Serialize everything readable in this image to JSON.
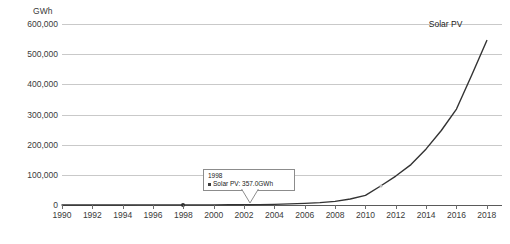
{
  "chart_data": {
    "type": "line",
    "title": "",
    "xlabel": "",
    "ylabel": "GWh",
    "unit_label": "GWh",
    "xlim": [
      1990,
      2019
    ],
    "ylim": [
      0,
      600000
    ],
    "grid": true,
    "legend_position": "inline-end-label",
    "y_ticks": [
      "600,000",
      "500,000",
      "400,000",
      "300,000",
      "200,000",
      "100,000",
      "0"
    ],
    "y_tick_values": [
      600000,
      500000,
      400000,
      300000,
      200000,
      100000,
      0
    ],
    "x_ticks": [
      "1990",
      "1992",
      "1994",
      "1996",
      "1998",
      "2000",
      "2002",
      "2004",
      "2006",
      "2008",
      "2010",
      "2012",
      "2014",
      "2016",
      "2018"
    ],
    "x_tick_values": [
      1990,
      1992,
      1994,
      1996,
      1998,
      2000,
      2002,
      2004,
      2006,
      2008,
      2010,
      2012,
      2014,
      2016,
      2018
    ],
    "series": [
      {
        "name": "Solar PV",
        "color": "#333333",
        "x": [
          1990,
          1991,
          1992,
          1993,
          1994,
          1995,
          1996,
          1997,
          1998,
          1999,
          2000,
          2001,
          2002,
          2003,
          2004,
          2005,
          2006,
          2007,
          2008,
          2009,
          2010,
          2011,
          2012,
          2013,
          2014,
          2015,
          2016,
          2017,
          2018
        ],
        "values": [
          90,
          110,
          135,
          165,
          200,
          250,
          300,
          330,
          357,
          430,
          560,
          720,
          950,
          1400,
          2200,
          3600,
          5500,
          8000,
          12000,
          20000,
          32000,
          63000,
          96000,
          134000,
          186000,
          247000,
          318000,
          430000,
          545000
        ]
      }
    ],
    "annotations": [
      {
        "type": "tooltip",
        "title": "1998",
        "series_name": "Solar PV",
        "value_text": "Solar PV: 357.0GWh",
        "swatch_color": "#3c3c3c",
        "anchor_year": 1998,
        "anchor_value": 357
      },
      {
        "type": "series-end-label",
        "text": "Solar PV"
      }
    ],
    "markers": [
      {
        "year": 1998,
        "value": 357,
        "style": "filled"
      },
      {
        "year": 2011,
        "value": 63000,
        "style": "hollow"
      }
    ]
  },
  "axes": {
    "unit": "GWh"
  }
}
